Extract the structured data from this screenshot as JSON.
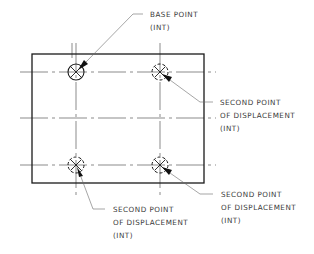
{
  "diagram": {
    "type": "cad-annotation",
    "colors": {
      "outline": "#1a1a1a",
      "centerline": "#5a5a5a",
      "leader": "#6a6a6a",
      "text": "#3a3a3a"
    },
    "plate": {
      "x": 32,
      "y": 54,
      "width": 172,
      "height": 129
    },
    "points": [
      {
        "id": "base",
        "x": 76,
        "y": 72,
        "style": "solid"
      },
      {
        "id": "upper-right",
        "x": 160,
        "y": 72,
        "style": "dashed"
      },
      {
        "id": "lower-left",
        "x": 76,
        "y": 165,
        "style": "dashed"
      },
      {
        "id": "lower-right",
        "x": 160,
        "y": 165,
        "style": "dashed"
      }
    ],
    "labels": {
      "base_point": {
        "line1": "BASE POINT",
        "line2": "(INT)"
      },
      "upper_right": {
        "line1": "SECOND POINT",
        "line2": "OF DISPLACEMENT",
        "line3": "(INT)"
      },
      "lower_right": {
        "line1": "SECOND POINT",
        "line2": "OF DISPLACEMENT",
        "line3": "(INT)"
      },
      "lower_left": {
        "line1": "SECOND POINT",
        "line2": "OF DISPLACEMENT",
        "line3": "(INT)"
      }
    }
  }
}
